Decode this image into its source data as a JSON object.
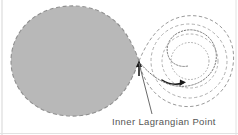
{
  "figure": {
    "type": "diagram",
    "width": 238,
    "height": 135,
    "background_color": "#ffffff"
  },
  "labels": {
    "inner_lagrangian_point": "Inner Lagrangian Point"
  },
  "colors": {
    "lobe_fill": "#b8b8b8",
    "lobe_outline": "#8f8f8f",
    "compact_star_fill": "#b0b0b0",
    "compact_star_outline": "#8a8a8a",
    "dashed_curve": "#9a9a9a",
    "stream": "#6e6e6e",
    "arrow": "#1a1a1a",
    "leader_line": "#6a6a6a",
    "text": "#555555",
    "frame": "#cfcfcf"
  },
  "elements": {
    "donor_star_lobe": {
      "name": "filled Roche lobe of donor star",
      "fill": "#b8b8b8",
      "outline_style": "dashed",
      "center_x": 72,
      "center_y": 60,
      "radius_x": 62,
      "radius_y": 56
    },
    "accretor_lobe": {
      "name": "Roche lobe of compact accretor",
      "outline_style": "dashed",
      "center_x": 186,
      "center_y": 61,
      "radius_x": 48,
      "radius_y": 45
    },
    "accretion_disk_rings": {
      "name": "nested dashed accretion disk rings",
      "count": 3,
      "center_x": 190,
      "center_y": 61,
      "radii": [
        40,
        29,
        20
      ]
    },
    "compact_star": {
      "name": "compact star",
      "center_x": 190,
      "center_y": 61,
      "radius": 7,
      "fill": "#b0b0b0"
    },
    "accretion_stream": {
      "name": "gas stream from inner Lagrangian point",
      "start_x": 139,
      "start_y": 62,
      "style": "dotted spiral"
    },
    "rotation_arrow": {
      "name": "disk rotation direction arrow",
      "x": 164,
      "y": 81,
      "direction": "clockwise-right"
    },
    "l1_marker_arrow": {
      "name": "vertical pointer at inner Lagrangian point",
      "x": 139,
      "y_top": 62,
      "y_bottom": 75
    },
    "leader_line": {
      "name": "callout leader line to caption",
      "from_x": 139,
      "from_y": 63,
      "to_x": 152,
      "to_y": 114
    }
  }
}
